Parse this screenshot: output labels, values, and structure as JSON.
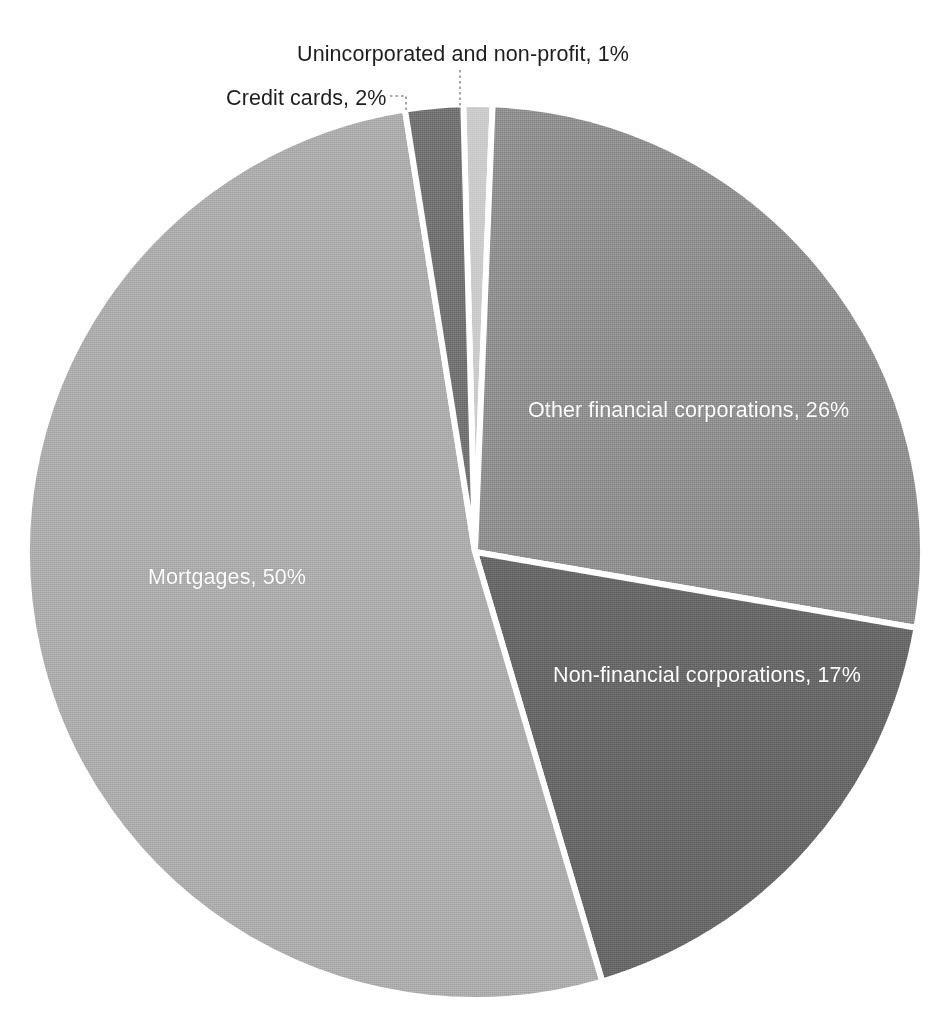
{
  "chart_data": {
    "type": "pie",
    "title": "",
    "subtitle": "",
    "xlabel": "",
    "ylabel": "",
    "legend_position": "none",
    "grid": false,
    "units": "percent",
    "total": 96,
    "categories": [
      "Unincorporated and non-profit",
      "Other financial corporations",
      "Non-financial corporations",
      "Mortgages",
      "Credit cards"
    ],
    "values": [
      1,
      26,
      17,
      50,
      2
    ],
    "slices": [
      {
        "name": "Unincorporated and non-profit",
        "value": 1,
        "value_text": "1%",
        "label": "Unincorporated and non-profit, 1%",
        "color": "#c9c9c9",
        "label_placement": "outside",
        "label_color": "#1d1d1d"
      },
      {
        "name": "Other financial corporations",
        "value": 26,
        "value_text": "26%",
        "label": "Other financial corporations, 26%",
        "color": "#8b8b8b",
        "label_placement": "inside",
        "label_color": "#ffffff"
      },
      {
        "name": "Non-financial corporations",
        "value": 17,
        "value_text": "17%",
        "label": "Non-financial corporations, 17%",
        "color": "#646464",
        "label_placement": "inside",
        "label_color": "#ffffff"
      },
      {
        "name": "Mortgages",
        "value": 50,
        "value_text": "50%",
        "label": "Mortgages, 50%",
        "color": "#a9a9a9",
        "label_placement": "inside",
        "label_color": "#ffffff"
      },
      {
        "name": "Credit cards",
        "value": 2,
        "value_text": "2%",
        "label": "Credit cards, 2%",
        "color": "#6e6e6e",
        "label_placement": "outside",
        "label_color": "#1d1d1d"
      }
    ],
    "slice_separator_color": "#ffffff",
    "background_color": "#ffffff"
  },
  "labels": {
    "unincorporated": "Unincorporated and non-profit, 1%",
    "credit_cards": "Credit cards, 2%",
    "other_financial": "Other financial corporations, 26%",
    "non_financial": "Non-financial corporations, 17%",
    "mortgages": "Mortgages, 50%"
  }
}
